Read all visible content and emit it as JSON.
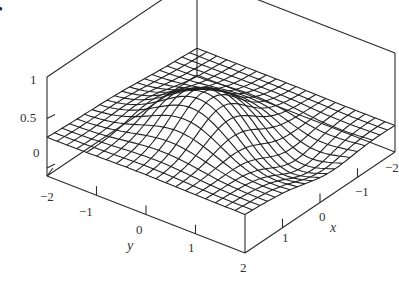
{
  "figure": {
    "bullet": "•"
  },
  "chart_data": {
    "type": "surface3d",
    "title": "",
    "xlabel": "x",
    "ylabel": "y",
    "zlabel": "",
    "x_range": [
      -2,
      2
    ],
    "y_range": [
      -2,
      2
    ],
    "z_range": [
      0,
      1
    ],
    "x_ticks": [
      "-2",
      "-1",
      "0",
      "1",
      "2"
    ],
    "y_ticks": [
      "-2",
      "-1",
      "0",
      "1",
      "2"
    ],
    "z_ticks": [
      "0",
      "0.5",
      "1"
    ],
    "grid_lines": 20,
    "surface_description": "Wireframe mesh around baseline z≈0.35, with a central peak (~0.75) near x≈0.3,y≈-0.2 and a trough near x≈1,y≈1",
    "box": true,
    "colors": {
      "line": "#222222",
      "background": "#ffffff"
    }
  },
  "labels": {
    "z_tick_1": "1",
    "z_tick_05": "0.5",
    "z_tick_0": "0",
    "y_tick_m2": "−2",
    "y_tick_m1": "−1",
    "y_tick_0": "0",
    "y_tick_1": "1",
    "corner_2": "2",
    "x_tick_1": "1",
    "x_tick_0": "0",
    "x_tick_m1": "−1",
    "x_tick_m2": "−2",
    "y_axis": "y",
    "x_axis": "x"
  }
}
